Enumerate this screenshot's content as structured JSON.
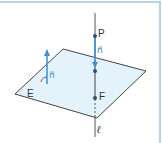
{
  "diagram": {
    "type": "geometry",
    "colors": {
      "border": "#9fc5e3",
      "plane_fill": "#dff1fa",
      "plane_edge": "#444444",
      "vector": "#3d8fd1",
      "line": "#555555",
      "point": "#2f4f6f"
    },
    "labels": {
      "point_p": "P",
      "normal_right": "n⃗",
      "normal_left": "n⃗",
      "point_f": "F",
      "plane": "E",
      "line": "ℓ"
    }
  }
}
